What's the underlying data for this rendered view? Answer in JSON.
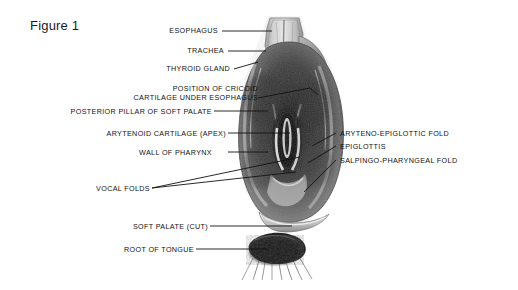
{
  "figure": {
    "caption": "Figure 1",
    "background_color": "#ffffff",
    "ink_color": "#121212"
  },
  "labels_left": [
    {
      "id": "esophagus",
      "text": "ESOPHAGUS",
      "lines": [
        "ESOPHAGUS"
      ]
    },
    {
      "id": "trachea",
      "text": "TRACHEA",
      "lines": [
        "TRACHEA"
      ]
    },
    {
      "id": "thyroid-gland",
      "text": "THYROID GLAND",
      "lines": [
        "THYROID GLAND"
      ]
    },
    {
      "id": "cricoid",
      "text": "POSITION OF CRICOID CARTILAGE UNDER ESOPHAGUS",
      "lines": [
        "POSITION OF CRICOID",
        "CARTILAGE UNDER ESOPHAGUS"
      ]
    },
    {
      "id": "posterior-pillar",
      "text": "POSTERIOR PILLAR OF SOFT PALATE",
      "lines": [
        "POSTERIOR PILLAR OF SOFT PALATE"
      ]
    },
    {
      "id": "arytenoid",
      "text": "ARYTENOID CARTILAGE (APEX)",
      "lines": [
        "ARYTENOID CARTILAGE (APEX)"
      ]
    },
    {
      "id": "wall-of-pharynx",
      "text": "WALL OF PHARYNX",
      "lines": [
        "WALL OF PHARYNX"
      ]
    },
    {
      "id": "vocal-folds",
      "text": "VOCAL FOLDS",
      "lines": [
        "VOCAL FOLDS"
      ]
    },
    {
      "id": "soft-palate-cut",
      "text": "SOFT PALATE (CUT)",
      "lines": [
        "SOFT PALATE (CUT)"
      ]
    },
    {
      "id": "root-of-tongue",
      "text": "ROOT OF TONGUE",
      "lines": [
        "ROOT OF TONGUE"
      ]
    }
  ],
  "labels_right": [
    {
      "id": "aryteno-epiglottic-fold",
      "text": "ARYTENO-EPIGLOTTIC FOLD"
    },
    {
      "id": "epiglottis",
      "text": "EPIGLOTTIS"
    },
    {
      "id": "salpingo-pharyngeal-fold",
      "text": "SALPINGO-PHARYNGEAL FOLD"
    }
  ]
}
